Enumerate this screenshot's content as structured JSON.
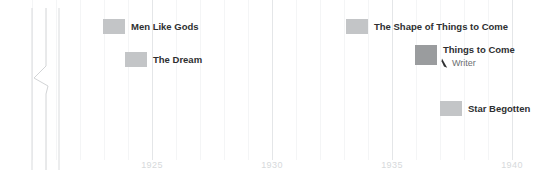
{
  "chart_data": {
    "type": "bar",
    "orientation": "horizontal",
    "title": "",
    "subtitle": "",
    "xlabel": "",
    "ylabel": "",
    "xlim": [
      1923.0,
      1941.5
    ],
    "x_ticks": [
      1925,
      1930,
      1935,
      1940
    ],
    "x_tick_labels": [
      "1925",
      "1930",
      "1935",
      "1940"
    ],
    "grid": {
      "major_vertical": true,
      "minor_vertical": true,
      "minor_step_years": 1,
      "horizontal": false
    },
    "legend": {
      "present": false,
      "position": "none"
    },
    "bar_color": "#c3c5c7",
    "bar_color_highlight": "#9a9c9e",
    "items": [
      {
        "label": "Men Like Gods",
        "start": 1925.6,
        "end": 1926.5,
        "row": 0,
        "highlight": false,
        "annotation": ""
      },
      {
        "label": "The Dream",
        "start": 1926.5,
        "end": 1927.4,
        "row": 1,
        "highlight": false,
        "annotation": ""
      },
      {
        "label": "The Shape of Things to Come",
        "start": 1935.7,
        "end": 1936.6,
        "row": 0,
        "highlight": false,
        "annotation": ""
      },
      {
        "label": "Things to Come",
        "start": 1938.8,
        "end": 1939.7,
        "row": 1,
        "highlight": true,
        "annotation": "Writer"
      },
      {
        "label": "Star Begotten",
        "start": 1939.7,
        "end": 1940.6,
        "row": 2,
        "highlight": false,
        "annotation": ""
      }
    ],
    "annotations": [
      {
        "text": "Writer",
        "icon": "pen-nib-icon",
        "attached_to": "Things to Come"
      }
    ],
    "axis_break": {
      "present": true,
      "style": "zigzag-vertical-lines",
      "line_count": 3,
      "color": "#d5d7d9"
    }
  },
  "axis": {
    "ticks": [
      {
        "label": "1925",
        "x": 152
      },
      {
        "label": "1930",
        "x": 272
      },
      {
        "label": "1935",
        "x": 392
      },
      {
        "label": "1940",
        "x": 512
      }
    ],
    "tick_color": "#d6d9db"
  },
  "bars": [
    {
      "label": "Men Like Gods",
      "x": 103,
      "y": 19,
      "w": 22,
      "h": 15,
      "label_x": 131,
      "label_y": 21,
      "highlight": false
    },
    {
      "label": "The Dream",
      "x": 125,
      "y": 52,
      "w": 22,
      "h": 15,
      "label_x": 153,
      "label_y": 54,
      "highlight": false
    },
    {
      "label": "The Shape of Things to Come",
      "x": 346,
      "y": 19,
      "w": 22,
      "h": 15,
      "label_x": 374,
      "label_y": 21,
      "highlight": false
    },
    {
      "label": "Things to Come",
      "x": 415,
      "y": 45,
      "w": 22,
      "h": 20,
      "label_x": 443,
      "label_y": 44,
      "highlight": true
    },
    {
      "label": "Star Begotten",
      "x": 440,
      "y": 101,
      "w": 22,
      "h": 15,
      "label_x": 468,
      "label_y": 103,
      "highlight": false
    }
  ],
  "sub_annotation": {
    "text": "Writer",
    "x": 452,
    "y": 58,
    "icon_name": "pen-nib-icon",
    "icon_x": 441,
    "icon_y": 55
  },
  "minor_gridlines_x": [
    32,
    56,
    80,
    104,
    128,
    176,
    200,
    224,
    248,
    296,
    320,
    344,
    368,
    416,
    440,
    464,
    488
  ],
  "major_gridlines_x": [
    152,
    272,
    392,
    512
  ]
}
